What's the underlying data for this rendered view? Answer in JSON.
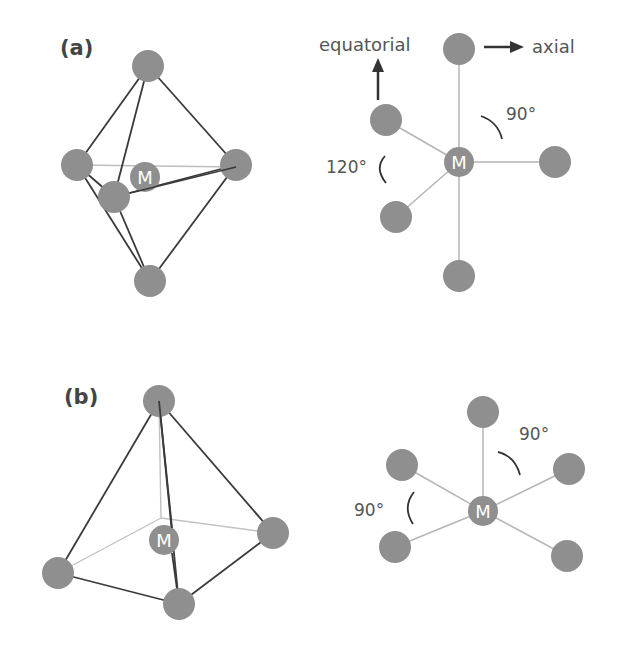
{
  "figure": {
    "panel_a": {
      "label": "(a)",
      "center_atom": "M",
      "geometry": "trigonal bipyramidal",
      "annotations": {
        "equatorial": "equatorial",
        "axial": "axial",
        "angle_axial": "90°",
        "angle_equatorial": "120°"
      }
    },
    "panel_b": {
      "label": "(b)",
      "center_atom": "M",
      "geometry": "square pyramidal",
      "annotations": {
        "angle_top": "90°",
        "angle_left": "90°"
      }
    }
  },
  "colors": {
    "atom": "#8f8f8f",
    "bond_dark": "#3a3a3a",
    "bond_light": "#b5b5b5",
    "text": "#555555"
  }
}
